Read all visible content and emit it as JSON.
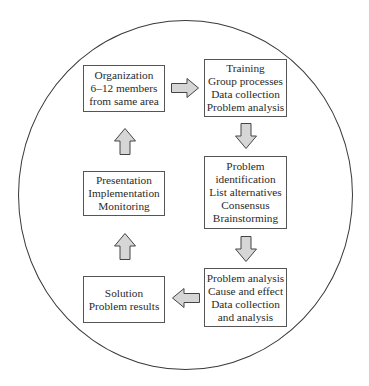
{
  "diagram": {
    "type": "cycle",
    "container": "circle",
    "steps": [
      {
        "id": "organization",
        "lines": [
          "Organization",
          "6–12 members",
          "from same area"
        ]
      },
      {
        "id": "training",
        "lines": [
          "Training",
          "Group processes",
          "Data collection",
          "Problem analysis"
        ]
      },
      {
        "id": "problem-identification",
        "lines": [
          "Problem",
          "identification",
          "List alternatives",
          "Consensus",
          "Brainstorming"
        ]
      },
      {
        "id": "problem-analysis",
        "lines": [
          "Problem analysis",
          "Cause and effect",
          "Data collection",
          "and analysis"
        ]
      },
      {
        "id": "solution",
        "lines": [
          "Solution",
          "Problem results"
        ]
      },
      {
        "id": "presentation",
        "lines": [
          "Presentation",
          "Implementation",
          "Monitoring"
        ]
      }
    ],
    "flow": [
      {
        "from": "organization",
        "to": "training",
        "direction": "right"
      },
      {
        "from": "training",
        "to": "problem-identification",
        "direction": "down"
      },
      {
        "from": "problem-identification",
        "to": "problem-analysis",
        "direction": "down"
      },
      {
        "from": "problem-analysis",
        "to": "solution",
        "direction": "left"
      },
      {
        "from": "solution",
        "to": "presentation",
        "direction": "up"
      },
      {
        "from": "presentation",
        "to": "organization",
        "direction": "up"
      }
    ],
    "colors": {
      "arrow_fill": "#d6d6d6",
      "stroke": "#444444",
      "text": "#2a2a2a"
    }
  }
}
